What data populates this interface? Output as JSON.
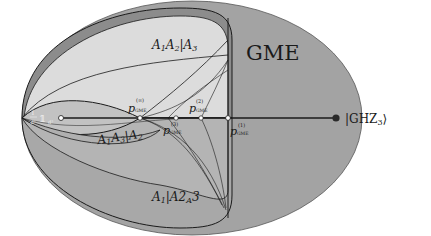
{
  "regions": {
    "gme": {
      "label": "GME"
    },
    "a1a2_a3": {
      "label_parts": [
        "A",
        "1",
        "A",
        "2",
        "|A",
        "3"
      ],
      "label": "A1A2|A3"
    },
    "a1a3_a2": {
      "label_parts": [
        "A",
        "1",
        "A",
        "3",
        "|A",
        "2"
      ],
      "label": "A1A3|A2"
    },
    "a1_a2a3": {
      "label_parts": [
        "A",
        "1",
        "|A",
        "2",
        "A",
        "3"
      ],
      "label": "A1|A2A3"
    }
  },
  "points": {
    "maximally_mixed": {
      "frac_num": "1",
      "frac_den": "d³",
      "symbol": "𝟙",
      "sub": "d³",
      "label": "1/d³ 𝟙_d³"
    },
    "ghz": {
      "label": "|GHZ₃⟩",
      "main": "|GHZ",
      "sub": "3",
      "close": "⟩"
    },
    "p_inf": {
      "main": "p",
      "sub": "GME",
      "sup": "(∞)"
    },
    "p_3": {
      "main": "p",
      "sub": "GME",
      "sup": "(3)"
    },
    "p_2": {
      "main": "p",
      "sub": "GME",
      "sup": "(2)"
    },
    "p_1": {
      "main": "p",
      "sub": "GME",
      "sup": "(1)"
    }
  },
  "colors": {
    "gme_fill": "#a3a3a3",
    "outer_band": "#8c8c8c",
    "biseparable_fill": "#c2c2c2",
    "light_region": "#dcdcdc",
    "line": "#1a1a1a",
    "ghz_dot": "#2a2a2a",
    "mixed_label": "#f0f0f0"
  }
}
